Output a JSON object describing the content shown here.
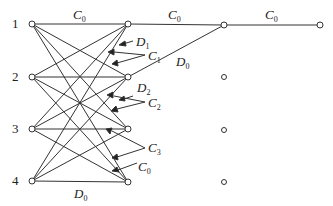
{
  "diagram": {
    "type": "network",
    "row_labels": [
      "1",
      "2",
      "3",
      "4"
    ],
    "edge_labels": {
      "top_c0_1": {
        "var": "C",
        "sub": "0"
      },
      "top_c0_2": {
        "var": "C",
        "sub": "0"
      },
      "top_c0_3": {
        "var": "C",
        "sub": "0"
      },
      "d1": {
        "var": "D",
        "sub": "1"
      },
      "c1": {
        "var": "C",
        "sub": "1"
      },
      "d0_diag": {
        "var": "D",
        "sub": "0"
      },
      "d2": {
        "var": "D",
        "sub": "2"
      },
      "c2": {
        "var": "C",
        "sub": "2"
      },
      "c3": {
        "var": "C",
        "sub": "3"
      },
      "c0_low": {
        "var": "C",
        "sub": "0"
      },
      "d0_bottom": {
        "var": "D",
        "sub": "0"
      }
    },
    "stroke_color": "#333333",
    "node_fill": "#ffffff"
  }
}
